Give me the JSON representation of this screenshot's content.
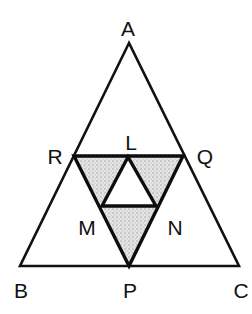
{
  "diagram": {
    "colors": {
      "line": "#111111",
      "shade": "#c9c9c9",
      "background": "#ffffff"
    },
    "points": {
      "A": {
        "label": "A",
        "x": 129,
        "y": 43
      },
      "B": {
        "label": "B",
        "x": 20,
        "y": 266
      },
      "C": {
        "label": "C",
        "x": 239,
        "y": 266
      },
      "P": {
        "label": "P",
        "x": 129,
        "y": 266
      },
      "Q": {
        "label": "Q",
        "x": 183,
        "y": 156
      },
      "R": {
        "label": "R",
        "x": 74,
        "y": 156
      },
      "L": {
        "label": "L",
        "x": 128,
        "y": 157
      },
      "M": {
        "label": "M",
        "x": 102,
        "y": 206
      },
      "N": {
        "label": "N",
        "x": 156,
        "y": 206
      }
    },
    "labels": [
      {
        "text": "A",
        "x": 128,
        "y": 36
      },
      {
        "text": "R",
        "x": 55,
        "y": 164
      },
      {
        "text": "L",
        "x": 131,
        "y": 150
      },
      {
        "text": "Q",
        "x": 205,
        "y": 164
      },
      {
        "text": "M",
        "x": 87,
        "y": 235
      },
      {
        "text": "N",
        "x": 175,
        "y": 235
      },
      {
        "text": "B",
        "x": 21,
        "y": 298
      },
      {
        "text": "P",
        "x": 130,
        "y": 298
      },
      {
        "text": "C",
        "x": 241,
        "y": 298
      }
    ],
    "shaded_triangles": [
      "RLM",
      "LQN",
      "MNP"
    ]
  }
}
